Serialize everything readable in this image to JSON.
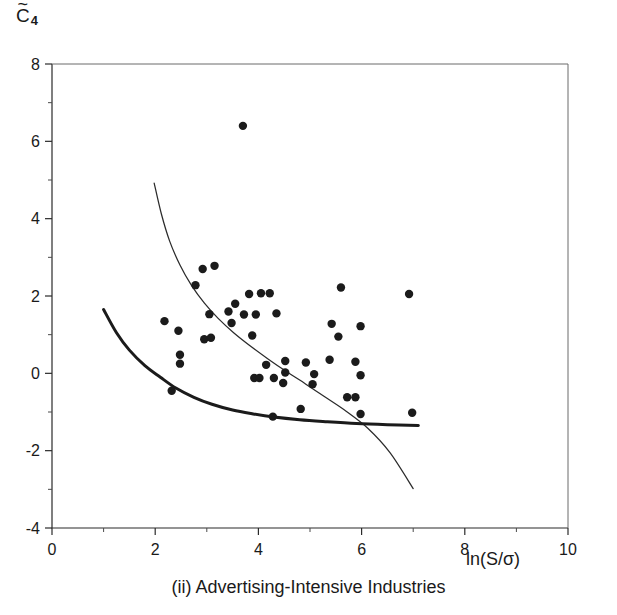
{
  "figure": {
    "caption": "(ii) Advertising-Intensive Industries",
    "ylabel_base": "C",
    "ylabel_tilde": "~",
    "ylabel_subscript": "4",
    "xlabel": "ln(S/σ)",
    "colors": {
      "point": "#1b1b1b",
      "curve_thin": "#2b2b2b",
      "curve_thick": "#1b1b1b",
      "axis": "#2b2b2b",
      "frame": "#6a6a6a",
      "background": "#ffffff"
    }
  },
  "chart_data": {
    "type": "scatter",
    "title": "",
    "subtitle": "(ii) Advertising-Intensive Industries",
    "xlabel": "ln(S/σ)",
    "ylabel": "C̄4",
    "xlim": [
      0,
      10
    ],
    "ylim": [
      -4,
      8
    ],
    "xticks": [
      0,
      2,
      4,
      6,
      8,
      10
    ],
    "yticks": [
      8,
      6,
      4,
      2,
      0,
      -2,
      -4
    ],
    "xticklabels": [
      "0",
      "2",
      "4",
      "6",
      "8",
      "10"
    ],
    "yticklabels": [
      "8",
      "6",
      "4",
      "2",
      "0",
      "-2",
      "-4"
    ],
    "xminorticks": [
      1,
      3,
      5,
      7,
      9
    ],
    "yminorticks": [
      7,
      5,
      3,
      1,
      -1,
      -3
    ],
    "grid": false,
    "legend": null,
    "points": [
      [
        3.7,
        6.4
      ],
      [
        2.92,
        2.7
      ],
      [
        3.15,
        2.78
      ],
      [
        2.78,
        2.28
      ],
      [
        3.82,
        2.05
      ],
      [
        4.05,
        2.07
      ],
      [
        4.22,
        2.07
      ],
      [
        5.6,
        2.22
      ],
      [
        6.92,
        2.05
      ],
      [
        3.55,
        1.8
      ],
      [
        3.42,
        1.6
      ],
      [
        3.72,
        1.52
      ],
      [
        4.35,
        1.55
      ],
      [
        3.05,
        1.53
      ],
      [
        3.95,
        1.52
      ],
      [
        2.18,
        1.35
      ],
      [
        3.48,
        1.3
      ],
      [
        5.42,
        1.28
      ],
      [
        2.45,
        1.1
      ],
      [
        5.98,
        1.22
      ],
      [
        3.88,
        0.98
      ],
      [
        2.95,
        0.88
      ],
      [
        3.08,
        0.92
      ],
      [
        5.55,
        0.95
      ],
      [
        2.48,
        0.48
      ],
      [
        4.52,
        0.32
      ],
      [
        5.38,
        0.35
      ],
      [
        5.88,
        0.3
      ],
      [
        4.92,
        0.28
      ],
      [
        2.48,
        0.25
      ],
      [
        4.15,
        0.22
      ],
      [
        4.52,
        0.02
      ],
      [
        5.08,
        -0.02
      ],
      [
        5.98,
        -0.05
      ],
      [
        3.92,
        -0.12
      ],
      [
        4.02,
        -0.12
      ],
      [
        4.3,
        -0.12
      ],
      [
        5.05,
        -0.28
      ],
      [
        4.48,
        -0.25
      ],
      [
        2.32,
        -0.45
      ],
      [
        5.72,
        -0.62
      ],
      [
        5.88,
        -0.62
      ],
      [
        4.28,
        -1.12
      ],
      [
        4.82,
        -0.92
      ],
      [
        5.98,
        -1.05
      ],
      [
        6.98,
        -1.02
      ]
    ],
    "curves": [
      {
        "name": "thin-curve",
        "style": "thin",
        "points": [
          [
            1.98,
            4.92
          ],
          [
            2.12,
            4.12
          ],
          [
            2.28,
            3.42
          ],
          [
            2.48,
            2.8
          ],
          [
            2.7,
            2.28
          ],
          [
            2.95,
            1.82
          ],
          [
            3.22,
            1.42
          ],
          [
            3.52,
            1.05
          ],
          [
            3.85,
            0.7
          ],
          [
            4.2,
            0.36
          ],
          [
            4.55,
            0.04
          ],
          [
            4.92,
            -0.28
          ],
          [
            5.3,
            -0.62
          ],
          [
            5.7,
            -0.98
          ],
          [
            6.12,
            -1.42
          ],
          [
            6.55,
            -2.05
          ],
          [
            7.0,
            -2.98
          ]
        ]
      },
      {
        "name": "thick-curve",
        "style": "thick",
        "points": [
          [
            1.0,
            1.65
          ],
          [
            1.25,
            1.05
          ],
          [
            1.5,
            0.6
          ],
          [
            1.8,
            0.2
          ],
          [
            2.1,
            -0.1
          ],
          [
            2.4,
            -0.38
          ],
          [
            2.75,
            -0.62
          ],
          [
            3.1,
            -0.8
          ],
          [
            3.5,
            -0.95
          ],
          [
            3.9,
            -1.05
          ],
          [
            4.3,
            -1.13
          ],
          [
            4.8,
            -1.2
          ],
          [
            5.3,
            -1.25
          ],
          [
            5.9,
            -1.3
          ],
          [
            6.5,
            -1.33
          ],
          [
            7.1,
            -1.35
          ]
        ]
      }
    ]
  }
}
